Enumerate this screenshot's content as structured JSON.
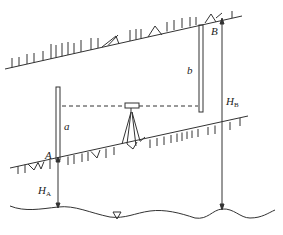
{
  "diagram": {
    "type": "leveling-measurement-schematic",
    "labels": {
      "point_a": "A",
      "point_b": "B",
      "reading_a": "a",
      "reading_b": "b",
      "height_a_main": "H",
      "height_a_sub": "A",
      "height_b_main": "H",
      "height_b_sub": "B"
    },
    "elements": {
      "upper_ground": "sloped ground surface at point B",
      "lower_ground": "sloped ground surface at point A",
      "staff_a": "leveling staff at A",
      "staff_b": "leveling staff at B",
      "level_instrument": "level on tripod",
      "sight_line": "horizontal line of sight (dashed)",
      "datum": "water surface / vertical datum",
      "datum_symbol": "▽"
    },
    "colors": {
      "line": "#333333",
      "background": "#ffffff"
    }
  }
}
